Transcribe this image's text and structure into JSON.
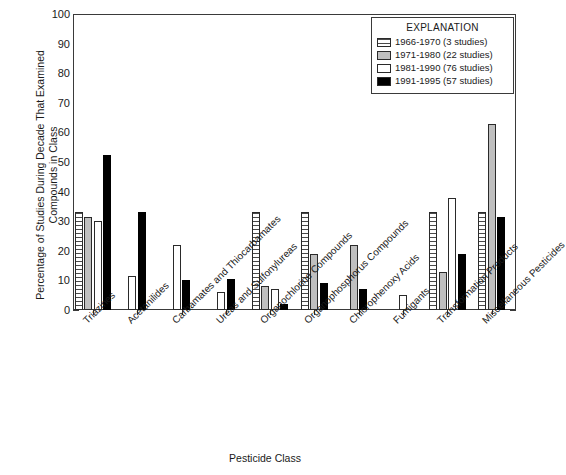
{
  "chart_data": {
    "type": "bar",
    "title": "",
    "xlabel": "Pesticide Class",
    "ylabel": "Percentage of Studies During Decade That Examined Compounds in Class",
    "ylim": [
      0,
      100
    ],
    "ytick_step": 10,
    "yminor_step": 2,
    "grid": false,
    "legend_position": "top-right",
    "legend_title": "EXPLANATION",
    "categories": [
      "Triazines",
      "Acetanilides",
      "Carbamates and Thiocarbamates",
      "Ureas and Sulfonylureas",
      "Organochlorine Compounds",
      "Organophosphorus Compounds",
      "Chlorophenoxy Acids",
      "Fumigants",
      "Transformation Products",
      "Miscellaneous Pesticides"
    ],
    "series": [
      {
        "name": "1966-1970 (3 studies)",
        "key": "1966",
        "color": "#ffffff",
        "pattern": "horizontal-stripes",
        "values": [
          33,
          0,
          0,
          0,
          33,
          33,
          0,
          0,
          33,
          33
        ]
      },
      {
        "name": "1971-1980 (22 studies)",
        "key": "1971",
        "color": "#bfbfbf",
        "pattern": "solid-gray",
        "values": [
          31.5,
          0,
          0,
          0,
          8,
          19,
          22,
          0,
          13,
          63
        ]
      },
      {
        "name": "1981-1990 (76 studies)",
        "key": "1981",
        "color": "#ffffff",
        "pattern": "solid-white",
        "values": [
          30,
          11.5,
          22,
          6,
          7,
          0,
          0,
          5,
          38,
          0
        ]
      },
      {
        "name": "1991-1995 (57 studies)",
        "key": "1991",
        "color": "#000000",
        "pattern": "solid-black",
        "values": [
          52.5,
          33,
          10,
          10.5,
          2,
          9,
          7,
          0,
          19,
          31.5
        ]
      }
    ],
    "ytick_labels": [
      "0",
      "10",
      "20",
      "30",
      "40",
      "50",
      "60",
      "70",
      "80",
      "90",
      "100"
    ]
  }
}
